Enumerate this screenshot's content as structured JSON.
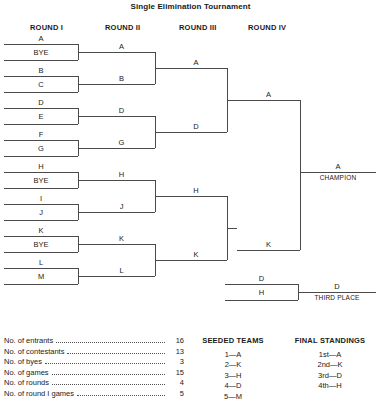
{
  "title": "Single Elimination Tournament",
  "round_headers": [
    {
      "label": "ROUND I"
    },
    {
      "label": "ROUND II"
    },
    {
      "label": "ROUND III"
    },
    {
      "label": "ROUND IV"
    }
  ],
  "round1": {
    "slots": [
      "A",
      "BYE",
      "B",
      "C",
      "D",
      "E",
      "F",
      "G",
      "H",
      "BYE",
      "I",
      "J",
      "K",
      "BYE",
      "L",
      "M"
    ]
  },
  "round2": {
    "slots": [
      "A",
      "B",
      "D",
      "G",
      "H",
      "J",
      "K",
      "L"
    ]
  },
  "round3": {
    "slots": [
      "A",
      "D",
      "H",
      "K"
    ]
  },
  "round4": {
    "slots": [
      "A",
      "K"
    ]
  },
  "champion": {
    "winner": "A",
    "caption": "CHAMPION"
  },
  "third_place": {
    "slots": [
      "D",
      "H"
    ],
    "winner": "D",
    "caption": "THIRD PLACE"
  },
  "stats": {
    "rows": [
      {
        "label": "No. of entrants",
        "value": "16"
      },
      {
        "label": "No. of contestants",
        "value": "13"
      },
      {
        "label": "No. of byes",
        "value": "3"
      },
      {
        "label": "No. of games",
        "value": "15"
      },
      {
        "label": "No. of rounds",
        "value": "4"
      },
      {
        "label": "No. of round I games",
        "value": "5"
      }
    ]
  },
  "seeded_teams": {
    "title": "SEEDED TEAMS",
    "items": [
      "1—A",
      "2—K",
      "3—H",
      "4—D",
      "5—M"
    ]
  },
  "final_standings": {
    "title": "FINAL STANDINGS",
    "items": [
      "1st—A",
      "2nd—K",
      "3rd—D",
      "4th—H"
    ]
  }
}
